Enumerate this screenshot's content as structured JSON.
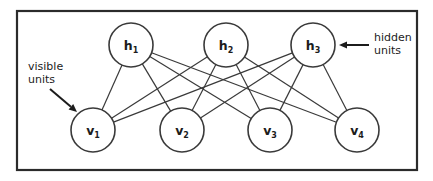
{
  "figure": {
    "background_color": "#ffffff",
    "frame": {
      "name": "diagram-border",
      "x": 17,
      "y": 11,
      "width": 400,
      "height": 159,
      "stroke_color": "#2b2b2b"
    }
  },
  "layers": {
    "hidden": {
      "layer_name": "hidden-layer",
      "y": 45,
      "radius": 22,
      "nodes": [
        {
          "id": "h1",
          "base": "h",
          "subscript": "1",
          "cx": 131,
          "cy": 45
        },
        {
          "id": "h2",
          "base": "h",
          "subscript": "2",
          "cx": 226,
          "cy": 45
        },
        {
          "id": "h3",
          "base": "h",
          "subscript": "3",
          "cx": 313,
          "cy": 45
        }
      ]
    },
    "visible": {
      "layer_name": "visible-layer",
      "y": 130,
      "radius": 22,
      "nodes": [
        {
          "id": "v1",
          "base": "v",
          "subscript": "1",
          "cx": 93,
          "cy": 130
        },
        {
          "id": "v2",
          "base": "v",
          "subscript": "2",
          "cx": 182,
          "cy": 130
        },
        {
          "id": "v3",
          "base": "v",
          "subscript": "3",
          "cx": 270,
          "cy": 130
        },
        {
          "id": "v4",
          "base": "v",
          "subscript": "4",
          "cx": 357,
          "cy": 130
        }
      ]
    }
  },
  "connections": {
    "description": "fully-connected bipartite edges between every hidden unit and every visible unit",
    "stroke_color": "#3a3a3a",
    "edges": [
      {
        "from": "h1",
        "to": "v1"
      },
      {
        "from": "h1",
        "to": "v2"
      },
      {
        "from": "h1",
        "to": "v3"
      },
      {
        "from": "h1",
        "to": "v4"
      },
      {
        "from": "h2",
        "to": "v1"
      },
      {
        "from": "h2",
        "to": "v2"
      },
      {
        "from": "h2",
        "to": "v3"
      },
      {
        "from": "h2",
        "to": "v4"
      },
      {
        "from": "h3",
        "to": "v1"
      },
      {
        "from": "h3",
        "to": "v2"
      },
      {
        "from": "h3",
        "to": "v3"
      },
      {
        "from": "h3",
        "to": "v4"
      }
    ]
  },
  "annotations": {
    "hidden_units": {
      "line1": "hidden",
      "line2": "units",
      "text_x": 374,
      "text_y1": 41,
      "text_y2": 54,
      "arrow": {
        "x1": 369,
        "y1": 45,
        "x2": 339,
        "y2": 45,
        "direction": "left"
      }
    },
    "visible_units": {
      "line1": "visible",
      "line2": "units",
      "text_x": 28,
      "text_y1": 70,
      "text_y2": 83,
      "arrow": {
        "x1": 50,
        "y1": 89,
        "x2": 77,
        "y2": 112,
        "direction": "down-right"
      }
    }
  }
}
